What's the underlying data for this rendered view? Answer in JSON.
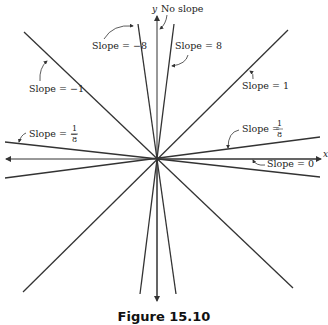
{
  "figure": {
    "caption": "Figure 15.10",
    "axes": {
      "x_label": "x",
      "y_label": "y",
      "y_note": "No slope"
    },
    "lines": [
      {
        "slope": "-8",
        "label": "Slope = −8"
      },
      {
        "slope": "8",
        "label": "Slope = 8"
      },
      {
        "slope": "-1",
        "label": "Slope = −1"
      },
      {
        "slope": "1",
        "label": "Slope = 1"
      },
      {
        "slope": "-1/8",
        "label_prefix": "Slope = −",
        "num": "1",
        "den": "8"
      },
      {
        "slope": "1/8",
        "label_prefix": "Slope = ",
        "num": "1",
        "den": "8"
      },
      {
        "slope": "0",
        "label": "Slope = 0"
      }
    ],
    "colors": {
      "line": "#333333",
      "background": "#ffffff"
    }
  }
}
